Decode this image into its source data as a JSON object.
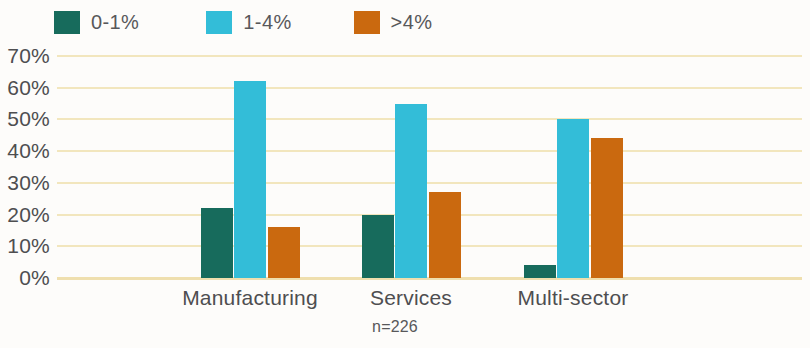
{
  "chart_data": {
    "type": "bar",
    "title": "",
    "subtitle": "",
    "xlabel": "",
    "ylabel": "",
    "caption": "n=226",
    "categories": [
      "Manufacturing",
      "Services",
      "Multi-sector"
    ],
    "series": [
      {
        "name": "0-1%",
        "color": "#176b5c",
        "values": [
          22,
          20,
          4
        ]
      },
      {
        "name": "1-4%",
        "color": "#33bdd8",
        "values": [
          62,
          55,
          50
        ]
      },
      {
        "name": ">4%",
        "color": "#ca690f",
        "values": [
          16,
          27,
          44
        ]
      }
    ],
    "ylim": [
      0,
      70
    ],
    "ytick_step": 10,
    "ytick_labels": [
      "70%",
      "60%",
      "50%",
      "40%",
      "30%",
      "20%",
      "10%",
      "0%"
    ],
    "ytick_values": [
      70,
      60,
      50,
      40,
      30,
      20,
      10,
      0
    ],
    "grid": true,
    "grid_color": "#f2e6bd",
    "legend_position": "top-left",
    "background_color": "#fdfcfa"
  }
}
